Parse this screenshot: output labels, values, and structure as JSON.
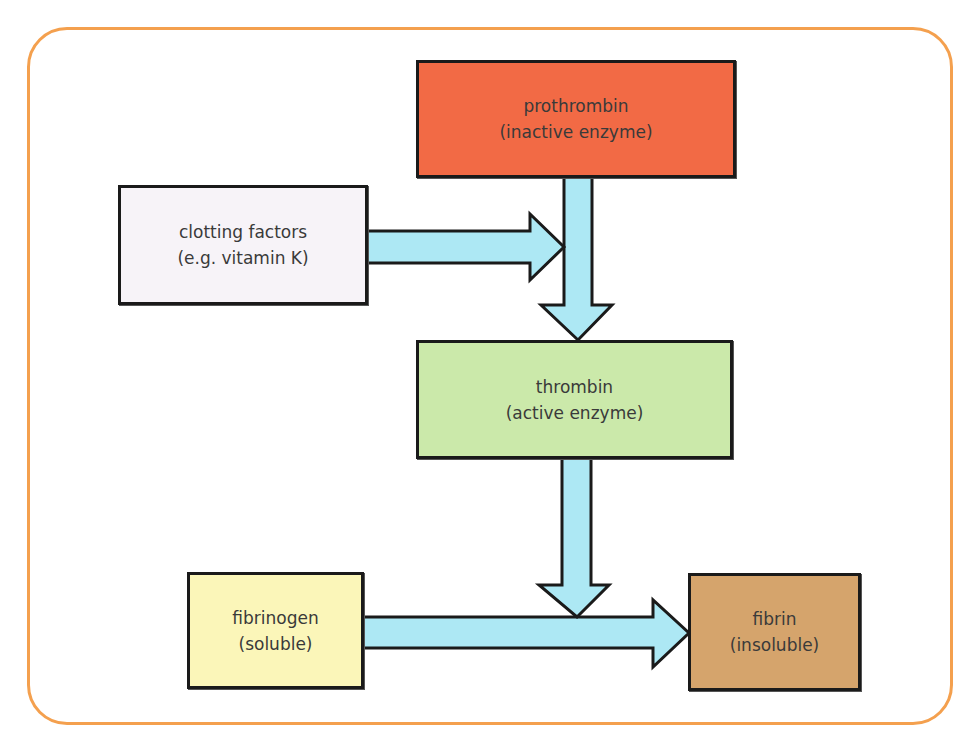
{
  "diagram": {
    "nodes": [
      {
        "id": "prothrombin",
        "line1": "prothrombin",
        "line2": "(inactive enzyme)",
        "color": "#F26A45"
      },
      {
        "id": "clotting",
        "line1": "clotting factors",
        "line2": "(e.g. vitamin K)",
        "color": "#F7F3F8"
      },
      {
        "id": "thrombin",
        "line1": "thrombin",
        "line2": "(active enzyme)",
        "color": "#CBE9AA"
      },
      {
        "id": "fibrinogen",
        "line1": "fibrinogen",
        "line2": "(soluble)",
        "color": "#FBF6B9"
      },
      {
        "id": "fibrin",
        "line1": "fibrin",
        "line2": "(insoluble)",
        "color": "#D5A46C"
      }
    ],
    "edges": [
      {
        "from": "prothrombin",
        "to": "thrombin"
      },
      {
        "from": "clotting",
        "to": "prothrombin-thrombin arrow"
      },
      {
        "from": "thrombin",
        "to": "fibrinogen-fibrin arrow"
      },
      {
        "from": "fibrinogen",
        "to": "fibrin"
      }
    ],
    "colors": {
      "frame": "#F4A04E",
      "arrow": "#ADE8F4",
      "outline": "#1a1a1a"
    }
  }
}
